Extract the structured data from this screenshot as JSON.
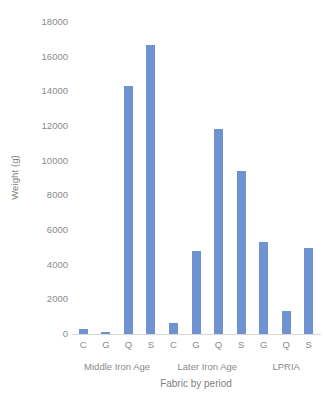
{
  "chart_data": {
    "type": "bar",
    "title": "",
    "xlabel": "Fabric by period",
    "ylabel": "Weight (g)",
    "ylim": [
      0,
      18000
    ],
    "ytick_step": 2000,
    "yticks": [
      18000,
      16000,
      14000,
      12000,
      10000,
      8000,
      6000,
      4000,
      2000,
      0
    ],
    "ytick_labels": [
      "18000",
      "16000",
      "14000",
      "12000",
      "10000",
      "8000",
      "6000",
      "4000",
      "2000",
      "0"
    ],
    "grid": false,
    "legend": "none",
    "bar_color": "#6f92d0",
    "categories": [
      "C",
      "G",
      "Q",
      "S",
      "C",
      "G",
      "Q",
      "S",
      "G",
      "Q",
      "S"
    ],
    "values": [
      280,
      90,
      14300,
      16700,
      650,
      4800,
      11800,
      9400,
      5300,
      1350,
      4950
    ],
    "groups": [
      {
        "label": "Middle Iron Age",
        "span": 4
      },
      {
        "label": "Later Iron Age",
        "span": 4
      },
      {
        "label": "LPRIA",
        "span": 3
      }
    ],
    "points": [
      {
        "group": "Middle Iron Age",
        "fabric": "C",
        "value": 280
      },
      {
        "group": "Middle Iron Age",
        "fabric": "G",
        "value": 90
      },
      {
        "group": "Middle Iron Age",
        "fabric": "Q",
        "value": 14300
      },
      {
        "group": "Middle Iron Age",
        "fabric": "S",
        "value": 16700
      },
      {
        "group": "Later Iron Age",
        "fabric": "C",
        "value": 650
      },
      {
        "group": "Later Iron Age",
        "fabric": "G",
        "value": 4800
      },
      {
        "group": "Later Iron Age",
        "fabric": "Q",
        "value": 11800
      },
      {
        "group": "Later Iron Age",
        "fabric": "S",
        "value": 9400
      },
      {
        "group": "LPRIA",
        "fabric": "G",
        "value": 5300
      },
      {
        "group": "LPRIA",
        "fabric": "Q",
        "value": 1350
      },
      {
        "group": "LPRIA",
        "fabric": "S",
        "value": 4950
      }
    ]
  }
}
